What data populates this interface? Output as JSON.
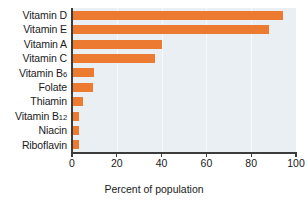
{
  "chart_data": {
    "type": "bar",
    "orientation": "horizontal",
    "title": "",
    "xlabel": "Percent of population",
    "ylabel": "",
    "categories": [
      "Vitamin D",
      "Vitamin E",
      "Vitamin A",
      "Vitamin C",
      "Vitamin B6",
      "Folate",
      "Thiamin",
      "Vitamin B12",
      "Niacin",
      "Riboflavin"
    ],
    "category_labels_html": [
      "Vitamin D",
      "Vitamin E",
      "Vitamin A",
      "Vitamin C",
      "Vitamin B<sub>6</sub>",
      "Folate",
      "Thiamin",
      "Vitamin B<sub>12</sub>",
      "Niacin",
      "Riboflavin"
    ],
    "values": [
      94,
      88,
      40,
      37,
      10,
      9.5,
      5,
      3,
      3,
      3
    ],
    "xlim": [
      0,
      100
    ],
    "xticks": [
      0,
      20,
      40,
      60,
      80,
      100
    ],
    "xtick_labels": [
      "0",
      "20",
      "40",
      "60",
      "80",
      "100"
    ],
    "grid": true,
    "grid_axis": "x",
    "legend": false,
    "bar_color": "#ec7b31",
    "plot_background": "#eaeff3",
    "gridline_color": "#f7fafc",
    "axis_color": "#3c3c3c"
  },
  "axis": {
    "x_title": "Percent of population"
  }
}
